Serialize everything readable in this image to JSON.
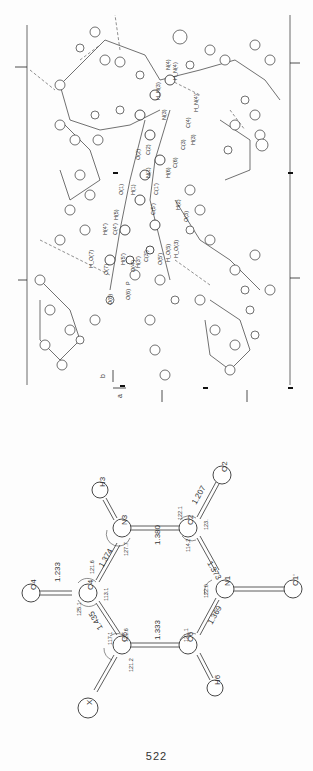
{
  "page": {
    "number": "522"
  },
  "packing_figure": {
    "axes": {
      "a": "a",
      "b": "b"
    },
    "labels": [
      "N(4)",
      "H_N(4)",
      "H_N(3)",
      "H_N(4)'",
      "N(3)",
      "C(4)",
      "H(3)",
      "C(3)",
      "O(2)",
      "C(2)",
      "N(1)",
      "H(6)",
      "C(6)",
      "O(1)",
      "H(1)",
      "C(1')",
      "H(2)",
      "O(3)",
      "H(5)",
      "C(5')",
      "H(4')",
      "C(4')",
      "H(5')",
      "H_O(3)",
      "H_O(5)",
      "O(5')",
      "C(3')",
      "H(3')",
      "O(4')",
      "H_O(7)",
      "O(7)",
      "P",
      "O(6)",
      "O(8)"
    ]
  },
  "schematic": {
    "atoms": [
      "O4",
      "C4",
      "N3",
      "H3",
      "C2",
      "O2",
      "N1",
      "C1'",
      "C6",
      "H6",
      "C5",
      "X"
    ],
    "bond_lengths": {
      "C4-O4": "1.233",
      "C4-N3": "1.374",
      "N3-C2": "1.380",
      "C2-O2": "1.207",
      "C2-N1": "1.373",
      "N1-C6": "1.369",
      "C6-C5": "1.333",
      "C5-C4": "1.435"
    },
    "angles": {
      "O4-C4-N3": "121.6",
      "O4-C4-C5": "125.1",
      "N3-C4-C5": "113.1",
      "C4-N3-C2": "127.7",
      "N3-C2-O2": "122.1",
      "N3-C2-N1": "114.2",
      "O2-C2-N1": "123.",
      "C2-N1-C6": "122.0",
      "N1-C6-C5": "121.1",
      "C4-C5-C6": "121.6",
      "C4-C5-X": "117.1",
      "C6-C5-X": "121.2"
    }
  }
}
